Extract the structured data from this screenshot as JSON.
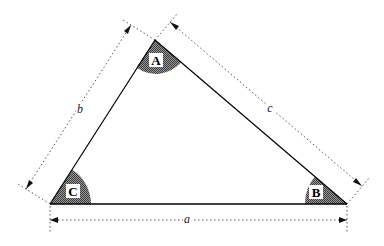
{
  "diagram": {
    "type": "triangle",
    "vertices": {
      "A": {
        "label": "A",
        "x": 155,
        "y": 40
      },
      "B": {
        "label": "B",
        "x": 347,
        "y": 204
      },
      "C": {
        "label": "C",
        "x": 50,
        "y": 204
      }
    },
    "sides": {
      "a": {
        "label": "a",
        "between": [
          "B",
          "C"
        ]
      },
      "b": {
        "label": "b",
        "between": [
          "A",
          "C"
        ]
      },
      "c": {
        "label": "c",
        "between": [
          "A",
          "B"
        ]
      }
    },
    "colors": {
      "line": "#000000",
      "angle_fill": "#7a7a7a",
      "dimension": "#555555",
      "background": "#ffffff"
    }
  }
}
